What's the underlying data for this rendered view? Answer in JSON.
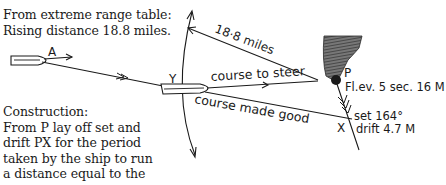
{
  "notes": {
    "range_table": {
      "line1": "From extreme range table:",
      "line2": "Rising distance 18.8 miles."
    },
    "construction": {
      "title": "Construction:",
      "line1": "From P lay off set and",
      "line2": "drift PX for the period",
      "line3": "taken by the ship to run",
      "line4": "a distance equal to the",
      "line5": "extreme range."
    }
  },
  "labels": {
    "point_a": "A",
    "point_y": "Y",
    "point_p": "P",
    "point_x": "X",
    "distance": "18·8 miles",
    "course_to_steer": "course to steer",
    "course_made_good": "course made good",
    "light_characteristic": "Fl.ev. 5 sec. 16 M",
    "set": "set 164°",
    "drift": "drift 4.7 M"
  },
  "colors": {
    "ink": "#1a1a1a",
    "land": "#555555",
    "background": "#ffffff"
  }
}
